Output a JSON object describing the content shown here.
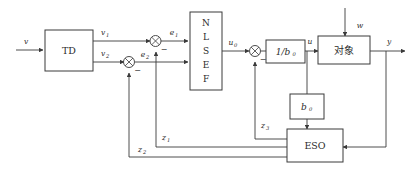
{
  "diagram": {
    "stroke_color": "#3a3a3a",
    "text_color": "#2b2b2b",
    "background_color": "#ffffff",
    "blocks": {
      "td": {
        "label": "TD",
        "name": "tracking-differentiator"
      },
      "nlsef": {
        "letters": [
          "N",
          "L",
          "S",
          "E",
          "F"
        ],
        "name": "nonlinear-state-error-feedback"
      },
      "inv_b0": {
        "label": "1/b",
        "sub": "0",
        "name": "inverse-gain"
      },
      "plant": {
        "label": "对象",
        "name": "plant"
      },
      "b0": {
        "label": "b",
        "sub": "0",
        "name": "gain"
      },
      "eso": {
        "label": "ESO",
        "name": "extended-state-observer"
      }
    },
    "signals": {
      "v": {
        "base": "v",
        "sub": ""
      },
      "v1": {
        "base": "v",
        "sub": "1"
      },
      "v2": {
        "base": "v",
        "sub": "2"
      },
      "e1": {
        "base": "e",
        "sub": "1"
      },
      "e2": {
        "base": "e",
        "sub": "2"
      },
      "u0": {
        "base": "u",
        "sub": "0"
      },
      "u": {
        "base": "u",
        "sub": ""
      },
      "w": {
        "base": "w",
        "sub": ""
      },
      "y": {
        "base": "y",
        "sub": ""
      },
      "z1": {
        "base": "z",
        "sub": "1"
      },
      "z2": {
        "base": "z",
        "sub": "2"
      },
      "z3": {
        "base": "z",
        "sub": "3"
      }
    },
    "summing_junctions": [
      {
        "name": "sum-e1",
        "sign": "−"
      },
      {
        "name": "sum-e2",
        "sign": "−"
      },
      {
        "name": "sum-u",
        "sign": "−"
      }
    ]
  }
}
